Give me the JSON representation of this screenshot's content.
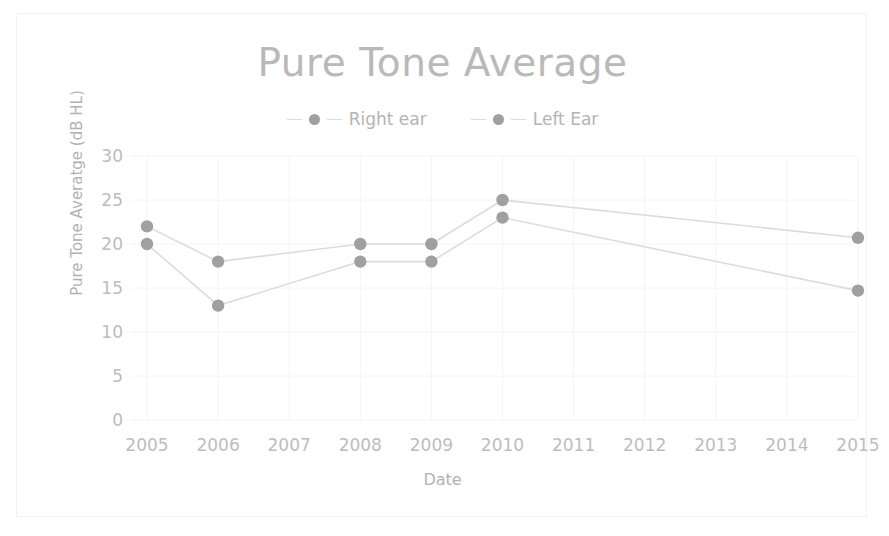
{
  "chart_data": {
    "type": "line",
    "title": "Pure Tone Average",
    "xlabel": "Date",
    "ylabel": "Pure Tone Averatge (dB HL)",
    "categories": [
      "2005",
      "2006",
      "2007",
      "2008",
      "2009",
      "2010",
      "2011",
      "2012",
      "2013",
      "2014",
      "2015"
    ],
    "x": [
      2005,
      2006,
      2007,
      2008,
      2009,
      2010,
      2011,
      2012,
      2013,
      2014,
      2015
    ],
    "xlim": [
      2005,
      2015
    ],
    "ylim": [
      0,
      30
    ],
    "yticks": [
      0,
      5,
      10,
      15,
      20,
      25,
      30
    ],
    "ytick_labels": [
      "0",
      "5",
      "10",
      "15",
      "20",
      "25",
      "30"
    ],
    "grid": true,
    "grid_axes": "both",
    "legend_position": "top",
    "markers": "circle",
    "series": [
      {
        "name": "Right ear",
        "color": "#a0a0a0",
        "points": [
          {
            "x": 2005,
            "y": 22
          },
          {
            "x": 2006,
            "y": 18
          },
          {
            "x": 2008,
            "y": 20
          },
          {
            "x": 2009,
            "y": 20
          },
          {
            "x": 2010,
            "y": 25
          },
          {
            "x": 2015,
            "y": 20.7
          }
        ],
        "values": [
          22,
          18,
          null,
          20,
          20,
          25,
          null,
          null,
          null,
          null,
          20.7
        ]
      },
      {
        "name": "Left Ear",
        "color": "#a0a0a0",
        "points": [
          {
            "x": 2005,
            "y": 20
          },
          {
            "x": 2006,
            "y": 13
          },
          {
            "x": 2008,
            "y": 18
          },
          {
            "x": 2009,
            "y": 18
          },
          {
            "x": 2010,
            "y": 23
          },
          {
            "x": 2015,
            "y": 14.7
          }
        ],
        "values": [
          20,
          13,
          null,
          18,
          18,
          23,
          null,
          null,
          null,
          null,
          14.7
        ]
      }
    ]
  },
  "chart": {
    "title": "Pure Tone Average",
    "x_axis_title": "Date",
    "y_axis_title": "Pure Tone Averatge (dB HL)"
  },
  "legend": {
    "entries": [
      {
        "label": "Right ear"
      },
      {
        "label": "Left Ear"
      }
    ]
  },
  "colors": {
    "title": "#b9b9b9",
    "tick_label": "#bdbdbd",
    "axis_title": "#b2b2b2",
    "series_marker": "#a0a0a0",
    "series_line": "#dcdcdc",
    "gridline": "#f4f4f4",
    "frame_border": "#f2f2f2",
    "background": "#ffffff"
  }
}
